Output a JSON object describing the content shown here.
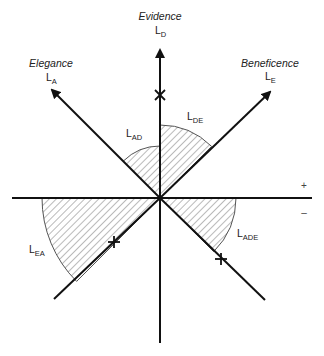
{
  "axes": {
    "evidence": {
      "title": "Evidence",
      "symbol": "L",
      "subscript": "D"
    },
    "elegance": {
      "title": "Elegance",
      "symbol": "L",
      "subscript": "A"
    },
    "beneficence": {
      "title": "Beneficence",
      "symbol": "L",
      "subscript": "E"
    }
  },
  "regions": {
    "de": {
      "symbol": "L",
      "subscript": "DE"
    },
    "ad": {
      "symbol": "L",
      "subscript": "AD"
    },
    "ea": {
      "symbol": "L",
      "subscript": "EA"
    },
    "ade": {
      "symbol": "L",
      "subscript": "ADE"
    }
  },
  "signs": {
    "plus": "+",
    "minus": "–"
  },
  "markers": [
    "x-marker",
    "plus-marker",
    "plus-marker"
  ],
  "colors": {
    "line": "#111111",
    "hatch": "#555555",
    "arc": "#555555"
  }
}
